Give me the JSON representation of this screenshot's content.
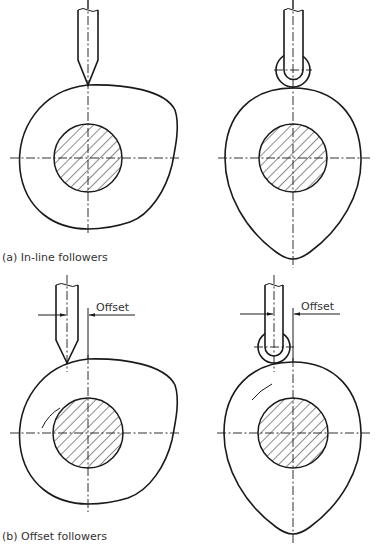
{
  "figure": {
    "panel_a": {
      "caption": "(a) In-line followers",
      "left": {
        "follower_type": "knife-edge",
        "cam_shape": "eccentric-round"
      },
      "right": {
        "follower_type": "roller",
        "cam_shape": "egg-pear"
      }
    },
    "panel_b": {
      "caption": "(b) Offset followers",
      "left": {
        "follower_type": "knife-edge",
        "cam_shape": "eccentric-round",
        "dimension_label": "Offset"
      },
      "right": {
        "follower_type": "roller",
        "cam_shape": "egg-pear",
        "dimension_label": "Offset"
      }
    },
    "colors": {
      "line": "#1a1a1a",
      "text": "#333333",
      "background": "#ffffff"
    }
  }
}
